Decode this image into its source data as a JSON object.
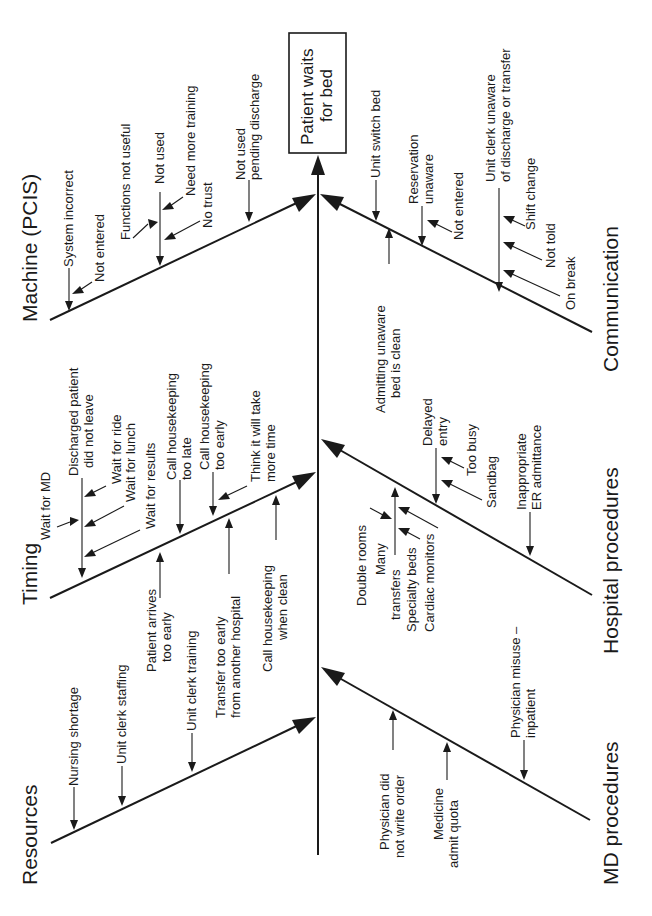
{
  "effect": {
    "line1": "Patient waits",
    "line2": "for bed"
  },
  "categories": {
    "machine": {
      "label": "Machine (PCIS)",
      "causes": {
        "system_incorrect": "System incorrect",
        "not_entered": "Not entered",
        "functions_not_useful": "Functions not useful",
        "not_used": "Not used",
        "need_more_training": "Need more training",
        "no_trust": "No trust",
        "not_used_pending_1": "Not used",
        "not_used_pending_2": "pending discharge"
      }
    },
    "timing": {
      "label": "Timing",
      "causes": {
        "wait_for_md": "Wait for MD",
        "discharged_1": "Discharged patient",
        "discharged_2": "did not leave",
        "wait_for_ride": "Wait for ride",
        "wait_for_lunch": "Wait for lunch",
        "wait_for_results": "Wait for results",
        "call_late_1": "Call housekeeping",
        "call_late_2": "too late",
        "call_early_1": "Call housekeeping",
        "call_early_2": "too early",
        "think_1": "Think it will take",
        "think_2": "more time",
        "patient_arrives_1": "Patient arrives",
        "patient_arrives_2": "too early",
        "transfer_1": "Transfer too early",
        "transfer_2": "from another hospital",
        "call_clean_1": "Call housekeeping",
        "call_clean_2": "when clean"
      }
    },
    "resources": {
      "label": "Resources",
      "causes": {
        "nursing_shortage": "Nursing shortage",
        "unit_clerk_staffing": "Unit clerk staffing",
        "unit_clerk_training": "Unit clerk training"
      }
    },
    "communication": {
      "label": "Communication",
      "causes": {
        "unit_switch_bed": "Unit switch bed",
        "reservation_1": "Reservation",
        "reservation_2": "unaware",
        "not_entered": "Not entered",
        "unit_clerk_1": "Unit clerk unaware",
        "unit_clerk_2": "of discharge or transfer",
        "shift_change": "Shift change",
        "not_told": "Not told",
        "on_break": "On break",
        "admitting_1": "Admitting unaware",
        "admitting_2": "bed is clean"
      }
    },
    "hospital": {
      "label": "Hospital procedures",
      "causes": {
        "delayed_1": "Delayed",
        "delayed_2": "entry",
        "too_busy": "Too busy",
        "sandbag": "Sandbag",
        "inappropriate_1": "Inappropriate",
        "inappropriate_2": "ER admittance",
        "double_rooms": "Double rooms",
        "many_transfers_1": "Many",
        "many_transfers_2": "transfers",
        "specialty_beds": "Specialty beds",
        "cardiac_monitors": "Cardiac monitors"
      }
    },
    "md": {
      "label": "MD procedures",
      "causes": {
        "physician_did_1": "Physician did",
        "physician_did_2": "not write order",
        "medicine_1": "Medicine",
        "medicine_2": "admit quota",
        "misuse_1": "Physician misuse –",
        "misuse_2": "inpatient"
      }
    }
  }
}
